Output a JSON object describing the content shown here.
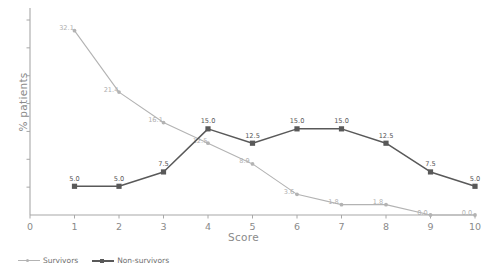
{
  "chart_data": {
    "type": "line",
    "title": "",
    "xlabel": "Score",
    "ylabel": "% patients",
    "x": [
      1,
      2,
      3,
      4,
      5,
      6,
      7,
      8,
      9,
      10
    ],
    "xticklabels": [
      "0",
      "1",
      "2",
      "3",
      "4",
      "5",
      "6",
      "7",
      "8",
      "9",
      "10"
    ],
    "xlim": [
      0,
      10
    ],
    "ylim": [
      0,
      35
    ],
    "yticklabels": [],
    "grid": false,
    "legend_position": "bottom-left",
    "series": [
      {
        "name": "Survivors",
        "color": "#b3b3b3",
        "marker": "circle",
        "values": [
          32.1,
          21.4,
          16.1,
          12.5,
          8.9,
          3.6,
          1.8,
          1.8,
          0.0,
          0.0
        ],
        "labels": [
          "32.1",
          "21.4",
          "16.1",
          "12.5",
          "8.9",
          "3.6",
          "1.8",
          "1.8",
          "0.0",
          "0.0"
        ]
      },
      {
        "name": "Non-survivors",
        "color": "#595959",
        "marker": "square",
        "values": [
          5.0,
          5.0,
          7.5,
          15.0,
          12.5,
          15.0,
          15.0,
          12.5,
          7.5,
          5.0
        ],
        "labels": [
          "5.0",
          "5.0",
          "7.5",
          "15.0",
          "12.5",
          "15.0",
          "15.0",
          "12.5",
          "7.5",
          "5.0"
        ]
      }
    ]
  },
  "axes": {
    "x_title": "Score",
    "y_title": "% patients",
    "x_ticks": [
      "0",
      "1",
      "2",
      "3",
      "4",
      "5",
      "6",
      "7",
      "8",
      "9",
      "10"
    ],
    "axis_color": "#a8a8a8"
  },
  "legend": {
    "items": [
      {
        "label": "Survivors",
        "color": "#b3b3b3",
        "marker": "circle"
      },
      {
        "label": "Non-survivors",
        "color": "#595959",
        "marker": "square"
      }
    ]
  }
}
